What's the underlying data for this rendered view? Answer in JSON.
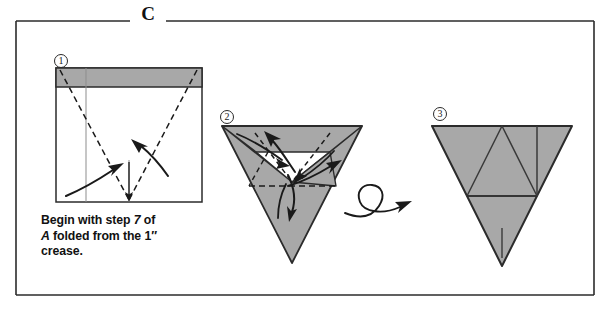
{
  "figure": {
    "section_letter": "C",
    "steps": [
      {
        "id": "step-1",
        "number": "①"
      },
      {
        "id": "step-2",
        "number": "②"
      },
      {
        "id": "step-3",
        "number": "③"
      }
    ],
    "caption": {
      "line1_a": "Begin with step ",
      "line1_b": "7",
      "line1_c": " of",
      "line2_a": "A",
      "line2_b": " folded from the 1″",
      "line3": "crease."
    },
    "colors": {
      "paper_shaded": "#a8a8a8",
      "paper_white": "#ffffff",
      "ink": "#1a1a1a",
      "border": "#2b2b2b",
      "background": "#ffffff"
    },
    "icons": {
      "turn_over": "turn-over-loop-arrow",
      "fold_arrow": "curved-fold-arrow",
      "valley_crease": "dashed-crease-line"
    }
  }
}
